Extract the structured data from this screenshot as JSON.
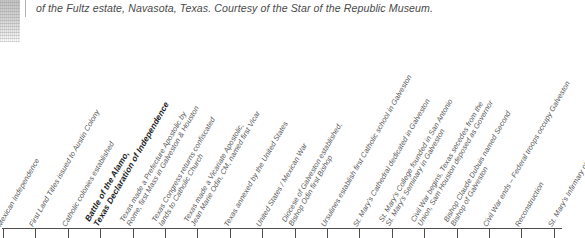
{
  "caption": {
    "text": "of the Fultz estate, Navasota, Texas. Courtesy of the Star of the Republic Museum."
  },
  "photo": {
    "alt_name": "faded-photo-fragment"
  },
  "timeline": {
    "axis_label": "",
    "tick_count": 18,
    "tick_start_x": 3,
    "tick_spacing": 32.4,
    "events": [
      {
        "x": 3,
        "bold": false,
        "lines": [
          "Mexican Independence"
        ]
      },
      {
        "x": 35.4,
        "bold": false,
        "lines": [
          "First Land Titles issued to Austin Colony"
        ]
      },
      {
        "x": 67.8,
        "bold": false,
        "lines": [
          "Catholic colonies established"
        ]
      },
      {
        "x": 100.2,
        "bold": true,
        "lines": [
          "Battle of the Alamo,",
          "Texas Declaration of Independence"
        ]
      },
      {
        "x": 132.6,
        "bold": false,
        "lines": [
          "Texas made a Prefecture Apostolic by",
          "Rome, first Mass in Galveston & Houston"
        ]
      },
      {
        "x": 165.0,
        "bold": false,
        "lines": [
          "Texas Congress returns confiscated",
          "lands to Catholic Church"
        ]
      },
      {
        "x": 197.4,
        "bold": false,
        "lines": [
          "Texas made a Vicariate Apostolic,",
          "Jean Marie Odin, CM, named first Vicar"
        ]
      },
      {
        "x": 229.8,
        "bold": false,
        "lines": [
          "Texas annexed by the United States"
        ]
      },
      {
        "x": 262.2,
        "bold": false,
        "lines": [
          "United States / Mexican War"
        ]
      },
      {
        "x": 294.6,
        "bold": false,
        "lines": [
          "Diocese of Galveston established,",
          "Bishop Odin first Bishop"
        ]
      },
      {
        "x": 327.0,
        "bold": false,
        "lines": [
          "Ursulines establish first Catholic school in Galveston"
        ]
      },
      {
        "x": 359.4,
        "bold": false,
        "lines": [
          "St. Mary's Cathedral dedicated in Galveston"
        ]
      },
      {
        "x": 391.8,
        "bold": false,
        "lines": [
          "St. Mary's College founded in San Antonio",
          "St. Mary's Seminary in Galveston"
        ]
      },
      {
        "x": 424.2,
        "bold": false,
        "lines": [
          "Civil War begins, Texas secedes from the",
          "Union, Sam Houston deposed as Governor"
        ]
      },
      {
        "x": 456.6,
        "bold": false,
        "lines": [
          "Bishop Claude Dubuis named Second",
          "Bishop of Galveston"
        ]
      },
      {
        "x": 489.0,
        "bold": false,
        "lines": [
          "Civil War ends – Federal troops occupy Galveston"
        ]
      },
      {
        "x": 521.4,
        "bold": false,
        "lines": [
          "Reconstruction"
        ]
      },
      {
        "x": 553.8,
        "bold": false,
        "lines": [
          "St. Mary's Infirmary opens"
        ]
      }
    ]
  }
}
